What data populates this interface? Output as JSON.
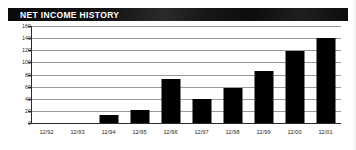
{
  "header": {
    "title": "NET INCOME HISTORY",
    "banner_color": "#0d0d0d",
    "title_color": "#ffffff"
  },
  "chart_data": {
    "type": "bar",
    "title": "NET INCOME HISTORY",
    "xlabel": "",
    "ylabel": "",
    "categories": [
      "12/92",
      "12/93",
      "12/94",
      "12/95",
      "12/96",
      "12/97",
      "12/98",
      "12/99",
      "12/00",
      "12/01"
    ],
    "values": [
      0,
      0,
      13,
      22,
      72,
      40,
      58,
      86,
      118,
      141
    ],
    "ylim": [
      0,
      160
    ],
    "yticks": [
      0,
      20,
      40,
      60,
      80,
      100,
      120,
      140,
      160
    ],
    "ytick_labels": [
      "0",
      "20",
      "40",
      "60",
      "80",
      "100",
      "120",
      "140",
      "160"
    ],
    "grid": true,
    "legend": "none",
    "bar_color": "#000000",
    "grid_color": "#9a9a9a",
    "axis_color": "#2b2b2b"
  }
}
